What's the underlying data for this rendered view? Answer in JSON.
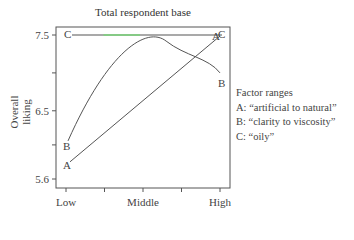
{
  "chart_data": {
    "type": "line",
    "title": "Total respondent base",
    "xlabel": "",
    "ylabel": "Overall liking",
    "categories": [
      "Low",
      "Middle",
      "High"
    ],
    "x_ticks": [
      "Low",
      "",
      "Middle",
      "",
      "High"
    ],
    "y_ticks": [
      {
        "value": 7.5,
        "label": "7.5"
      },
      {
        "value": 7.0,
        "label": ""
      },
      {
        "value": 6.5,
        "label": "6.5"
      },
      {
        "value": 6.05,
        "label": ""
      },
      {
        "value": 5.6,
        "label": "5.6"
      }
    ],
    "ylim": [
      5.5,
      7.6
    ],
    "grid": false,
    "legend_position": "right",
    "series": [
      {
        "name": "A",
        "description": "artificial to natural",
        "x": [
          0,
          1,
          2,
          3,
          4
        ],
        "values": [
          5.8,
          6.22,
          6.64,
          7.07,
          7.5
        ],
        "shape": "linear"
      },
      {
        "name": "B",
        "description": "clarity to viscosity",
        "x": [
          0,
          1,
          2,
          2.5,
          3,
          4
        ],
        "values": [
          6.05,
          6.95,
          7.35,
          7.42,
          7.38,
          7.0
        ],
        "shape": "quadratic"
      },
      {
        "name": "C",
        "description": "oily",
        "x": [
          0,
          4
        ],
        "values": [
          7.5,
          7.5
        ],
        "shape": "flat"
      }
    ]
  },
  "title": "Total respondent base",
  "ylabel": "Overall liking",
  "legend": {
    "heading": "Factor ranges",
    "items": [
      {
        "label": "A: “artificial to natural”"
      },
      {
        "label": "B: “clarity to viscosity”"
      },
      {
        "label": "C: “oily”"
      }
    ]
  },
  "colors": {
    "axis": "#555555",
    "line": "#555555",
    "highlight": "#7bd67b"
  }
}
